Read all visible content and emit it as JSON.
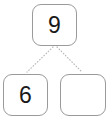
{
  "diagram": {
    "type": "number-bond",
    "canvas": {
      "width": 110,
      "height": 123,
      "background": "#ffffff"
    },
    "style": {
      "box_border_color": "#9a9a9a",
      "box_fill_color": "#ffffff",
      "text_color": "#1a1a1a",
      "connector_color": "#b9b9b9",
      "connector_style": "dotted"
    },
    "nodes": {
      "parent": {
        "label": "9",
        "role": "whole"
      },
      "child_left": {
        "label": "6",
        "role": "part"
      },
      "child_right": {
        "label": "",
        "role": "part-blank"
      }
    },
    "connectors": [
      {
        "from": "parent",
        "to": "child_left"
      },
      {
        "from": "parent",
        "to": "child_right"
      }
    ]
  }
}
